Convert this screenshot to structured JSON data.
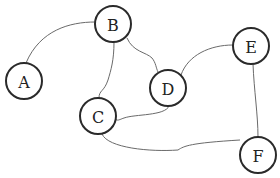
{
  "graph": {
    "nodes": [
      {
        "id": "A",
        "label": "A",
        "x": 24,
        "y": 81
      },
      {
        "id": "B",
        "label": "B",
        "x": 113,
        "y": 24
      },
      {
        "id": "C",
        "label": "C",
        "x": 98,
        "y": 116
      },
      {
        "id": "D",
        "label": "D",
        "x": 168,
        "y": 88
      },
      {
        "id": "E",
        "label": "E",
        "x": 251,
        "y": 46
      },
      {
        "id": "F",
        "label": "F",
        "x": 258,
        "y": 155
      }
    ],
    "edges": [
      {
        "from": "A",
        "to": "B"
      },
      {
        "from": "B",
        "to": "C"
      },
      {
        "from": "B",
        "to": "D"
      },
      {
        "from": "D",
        "to": "E"
      },
      {
        "from": "D",
        "to": "C"
      },
      {
        "from": "E",
        "to": "F"
      },
      {
        "from": "C",
        "to": "F"
      }
    ],
    "node_radius": 18,
    "colors": {
      "node_stroke": "#2a2a2a",
      "edge_stroke": "#6a6a6a",
      "background": "#ffffff"
    }
  }
}
